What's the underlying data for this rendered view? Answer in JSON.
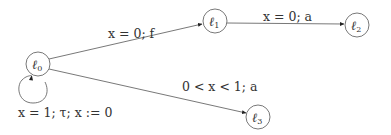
{
  "diagram": {
    "type": "timed-automaton",
    "nodes": [
      {
        "id": "l0",
        "label": "ℓ",
        "sub": "0",
        "cx": 38,
        "cy": 64
      },
      {
        "id": "l1",
        "label": "ℓ",
        "sub": "1",
        "cx": 215,
        "cy": 21
      },
      {
        "id": "l2",
        "label": "ℓ",
        "sub": "2",
        "cx": 357,
        "cy": 25
      },
      {
        "id": "l3",
        "label": "ℓ",
        "sub": "3",
        "cx": 258,
        "cy": 117
      }
    ],
    "edges": [
      {
        "from": "l0",
        "to": "l1",
        "label": "x = 0; f"
      },
      {
        "from": "l1",
        "to": "l2",
        "label": "x = 0; a"
      },
      {
        "from": "l0",
        "to": "l3",
        "label": "0 < x < 1; a"
      },
      {
        "from": "l0",
        "to": "l0",
        "label": "x = 1; τ; x := 0"
      }
    ]
  }
}
